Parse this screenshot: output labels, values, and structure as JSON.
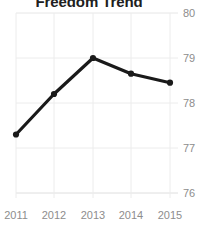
{
  "chart_data": {
    "type": "line",
    "title": "Freedom Trend",
    "xlabel": "",
    "ylabel": "",
    "categories": [
      "2011",
      "2012",
      "2013",
      "2014",
      "2015"
    ],
    "values": [
      77.3,
      78.2,
      79.0,
      78.65,
      78.45
    ],
    "series": [
      {
        "name": "Freedom Trend",
        "values": [
          77.3,
          78.2,
          79.0,
          78.65,
          78.45
        ]
      }
    ],
    "x": [
      2011,
      2012,
      2013,
      2014,
      2015
    ],
    "ylim": [
      76,
      80
    ],
    "yticks": [
      76,
      77,
      78,
      79,
      80
    ],
    "ytick_labels": [
      "76",
      "77",
      "78",
      "79",
      "80"
    ],
    "xtick_labels": [
      "2011",
      "2012",
      "2013",
      "2014",
      "2015"
    ],
    "grid": true,
    "grid_axis": "both",
    "legend": false,
    "legend_position": "none",
    "yaxis_position": "right",
    "marker": "circle",
    "colors": {
      "line": "#1a1a1a",
      "marker": "#1a1a1a",
      "grid": "#e4e4e4",
      "axis": "#d8d8d8",
      "tick_text": "#8d8d8d",
      "title_text": "#202020",
      "background": "#ffffff"
    }
  },
  "axes": {
    "y_ticks": [
      {
        "label": "80",
        "top": 7
      },
      {
        "label": "79",
        "top": 52
      },
      {
        "label": "78",
        "top": 97
      },
      {
        "label": "77",
        "top": 142
      },
      {
        "label": "76",
        "top": 187
      }
    ],
    "x_ticks": [
      {
        "label": "2011",
        "left": -1
      },
      {
        "label": "2012",
        "left": 37
      },
      {
        "label": "2013",
        "left": 76
      },
      {
        "label": "2014",
        "left": 114
      },
      {
        "label": "2015",
        "left": 153
      }
    ]
  }
}
